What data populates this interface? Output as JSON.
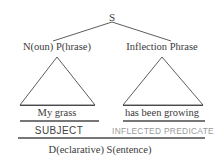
{
  "diagram": {
    "type": "syntax-tree",
    "root": {
      "label": "S"
    },
    "constituents": [
      {
        "category_label": "N(oun) P(hrase)",
        "terminal_text": "My grass",
        "function_label": "SUBJECT"
      },
      {
        "category_label": "Inflection Phrase",
        "terminal_text": "has been growing",
        "function_label": "INFLECTED PREDICATE"
      }
    ],
    "sentence_label": "D(eclarative) S(entence)",
    "colors": {
      "stroke": "#4a4a4a",
      "text": "#3a3a3a",
      "faded_text": "#9a9a9a",
      "background": "#ffffff"
    }
  }
}
